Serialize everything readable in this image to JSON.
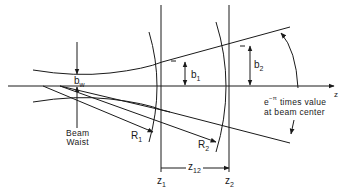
{
  "diagram": {
    "title": "",
    "labels": {
      "axis_z": "z",
      "bw_main": "b",
      "bw_sub": "w",
      "b1_main": "b",
      "b1_sub": "1",
      "b2_main": "b",
      "b2_sub": "2",
      "beam_waist_line1": "Beam",
      "beam_waist_line2": "Waist",
      "r1_main": "R",
      "r1_sub": "1",
      "r2_main": "R",
      "r2_sub": "2",
      "z1_main": "z",
      "z1_sub": "1",
      "z2_main": "z",
      "z2_sub": "2",
      "z12_main": "z",
      "z12_sub": "12",
      "annotation_base": "e",
      "annotation_exp": "−π",
      "annotation_line1": " times value",
      "annotation_line2": "at beam center"
    },
    "colors": {
      "ink": "#1a1a1a",
      "background": "#ffffff"
    }
  }
}
